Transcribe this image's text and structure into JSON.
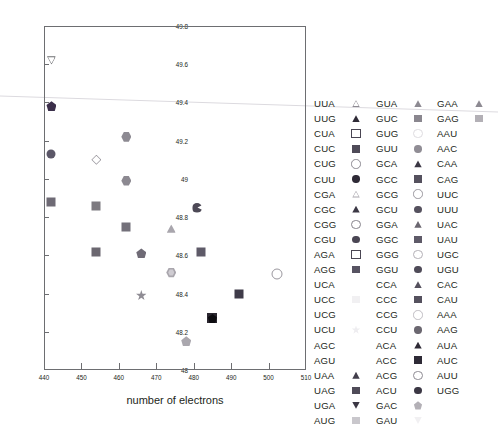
{
  "chart_data": {
    "type": "scatter",
    "title": "",
    "xlabel": "number of electrons",
    "ylabel": "",
    "xlim": [
      440,
      510
    ],
    "ylim": [
      48,
      49.8
    ],
    "xticks": [
      440,
      450,
      460,
      470,
      480,
      490,
      500,
      510
    ],
    "yticks": [
      "48",
      "48.2",
      "48.4",
      "48.6",
      "48.8",
      "49",
      "49.2",
      "49.4",
      "49.6",
      "49.8"
    ],
    "grid": false,
    "legend_position": "right",
    "legend_columns": 3,
    "points": [
      {
        "label": "UUA",
        "x": 442,
        "y": 49.62,
        "marker": "triangle-down-open",
        "color": "#ffffff",
        "edge": "#6d6e71"
      },
      {
        "label": "CUU",
        "x": 442,
        "y": 49.38,
        "marker": "pentagon-filled",
        "color": "#3b2f4a"
      },
      {
        "label": "CGU",
        "x": 442,
        "y": 49.13,
        "marker": "circle-filled",
        "color": "#5b5768"
      },
      {
        "label": "AGG",
        "x": 442,
        "y": 48.88,
        "marker": "square-filled",
        "color": "#6e6a75"
      },
      {
        "label": "GUC",
        "x": 454,
        "y": 48.86,
        "marker": "square-filled",
        "color": "#7d7a80"
      },
      {
        "label": "CGG",
        "x": 454,
        "y": 49.1,
        "marker": "diamond-open",
        "color": "#ffffff",
        "edge": "#9a979e"
      },
      {
        "label": "GCC",
        "x": 454,
        "y": 48.62,
        "marker": "square-filled",
        "color": "#6b6770"
      },
      {
        "label": "GUU",
        "x": 462,
        "y": 49.22,
        "marker": "hexagon-filled",
        "color": "#8d8a92"
      },
      {
        "label": "GGC",
        "x": 462,
        "y": 48.99,
        "marker": "hexagon-filled",
        "color": "#8c8991"
      },
      {
        "label": "CCC",
        "x": 462,
        "y": 48.75,
        "marker": "square-filled",
        "color": "#73707a"
      },
      {
        "label": "GCU",
        "x": 466,
        "y": 48.61,
        "marker": "pentagon-filled",
        "color": "#6f6b76"
      },
      {
        "label": "ACU",
        "x": 466,
        "y": 48.39,
        "marker": "star-filled",
        "color": "#8f8c94"
      },
      {
        "label": "GAC",
        "x": 474,
        "y": 48.74,
        "marker": "triangle-up-filled",
        "color": "#a9a6ad"
      },
      {
        "label": "UCU",
        "x": 474,
        "y": 48.51,
        "marker": "hexagon-open",
        "color": "#cfccd2",
        "edge": "#a9a6ad"
      },
      {
        "label": "AGU",
        "x": 478,
        "y": 48.15,
        "marker": "pentagon-filled",
        "color": "#aaa7ae"
      },
      {
        "label": "UGA",
        "x": 481,
        "y": 48.85,
        "marker": "pacman-filled",
        "color": "#4d4956"
      },
      {
        "label": "UAG",
        "x": 482,
        "y": 48.62,
        "marker": "square-filled",
        "color": "#5e5a68"
      },
      {
        "label": "AUG",
        "x": 485,
        "y": 48.27,
        "marker": "square-pentagon-overlap",
        "color": "#231f20"
      },
      {
        "label": "UCA",
        "x": 492,
        "y": 48.4,
        "marker": "square-filled",
        "color": "#3f3b49"
      },
      {
        "label": "UCC",
        "x": 502,
        "y": 48.51,
        "marker": "circle-open",
        "color": "#ffffff",
        "edge": "#9a979e"
      }
    ]
  },
  "axes": {
    "xlabel": "number of electrons",
    "xticks": [
      "440",
      "450",
      "460",
      "470",
      "480",
      "490",
      "500",
      "510"
    ],
    "yticks": [
      "48",
      "48.2",
      "48.4",
      "48.6",
      "48.8",
      "49",
      "49.2",
      "49.4",
      "49.6",
      "49.8"
    ]
  },
  "legend": {
    "columns": [
      {
        "entries": [
          {
            "label": "UUA",
            "marker": "triangle-up-open",
            "color": "#ffffff",
            "edge": "#8d8a92"
          },
          {
            "label": "UUG",
            "marker": "triangle-up-filled",
            "color": "#2e2a36",
            "edge": "#2e2a36"
          },
          {
            "label": "CUA",
            "marker": "square-open",
            "color": "#ffffff",
            "edge": "#4a4653"
          },
          {
            "label": "CUC",
            "marker": "square-filled",
            "color": "#4f4b58",
            "edge": "#4f4b58"
          },
          {
            "label": "CUG",
            "marker": "circle-open",
            "color": "#ffffff",
            "edge": "#8d8a92"
          },
          {
            "label": "CUU",
            "marker": "circle-filled",
            "color": "#2e2a36",
            "edge": "#2e2a36"
          },
          {
            "label": "CGA",
            "marker": "triangle-up-open",
            "color": "#ffffff",
            "edge": "#a9a6ad"
          },
          {
            "label": "CGC",
            "marker": "triangle-up-filled",
            "color": "#3b3744",
            "edge": "#3b3744"
          },
          {
            "label": "CGG",
            "marker": "circle-open",
            "color": "#ffffff",
            "edge": "#86838b"
          },
          {
            "label": "CGU",
            "marker": "circle-filled",
            "color": "#4a4653",
            "edge": "#4a4653"
          },
          {
            "label": "AGA",
            "marker": "square-open",
            "color": "#ffffff",
            "edge": "#4a4653"
          },
          {
            "label": "AGG",
            "marker": "square-filled",
            "color": "#575362",
            "edge": "#575362"
          },
          {
            "label": "UCA",
            "marker": "none",
            "color": "#ffffff",
            "edge": "#ffffff"
          },
          {
            "label": "UCC",
            "marker": "square-faint",
            "color": "#f1f0f2",
            "edge": "#f1f0f2"
          },
          {
            "label": "UCG",
            "marker": "none",
            "color": "#ffffff",
            "edge": "#ffffff"
          },
          {
            "label": "UCU",
            "marker": "star-faint",
            "color": "#eeedf0",
            "edge": "#eeedf0"
          },
          {
            "label": "AGC",
            "marker": "none",
            "color": "#ffffff",
            "edge": "#ffffff"
          },
          {
            "label": "AGU",
            "marker": "none",
            "color": "#ffffff",
            "edge": "#ffffff"
          },
          {
            "label": "UAA",
            "marker": "triangle-up-filled",
            "color": "#423e4b",
            "edge": "#423e4b"
          },
          {
            "label": "UAG",
            "marker": "square-filled",
            "color": "#4f4b58",
            "edge": "#4f4b58"
          },
          {
            "label": "UGA",
            "marker": "triangle-down-filled",
            "color": "#3b3744",
            "edge": "#3b3744"
          },
          {
            "label": "AUG",
            "marker": "square-filled",
            "color": "#c9c7cc",
            "edge": "#c9c7cc"
          }
        ]
      },
      {
        "entries": [
          {
            "label": "GUA",
            "marker": "triangle-up-filled",
            "color": "#8d8a92",
            "edge": "#8d8a92"
          },
          {
            "label": "GUC",
            "marker": "square-filled",
            "color": "#8a878f",
            "edge": "#8a878f"
          },
          {
            "label": "GUG",
            "marker": "circle-open",
            "color": "#ffffff",
            "edge": "#dedce0"
          },
          {
            "label": "GUU",
            "marker": "circle-filled",
            "color": "#908d95",
            "edge": "#908d95"
          },
          {
            "label": "GCA",
            "marker": "triangle-up-filled",
            "color": "#3b3744",
            "edge": "#3b3744"
          },
          {
            "label": "GCC",
            "marker": "square-filled",
            "color": "#55515e",
            "edge": "#55515e"
          },
          {
            "label": "GCG",
            "marker": "circle-open",
            "color": "#ffffff",
            "edge": "#9a979e"
          },
          {
            "label": "GCU",
            "marker": "circle-filled",
            "color": "#55515e",
            "edge": "#55515e"
          },
          {
            "label": "GGA",
            "marker": "triangle-up-filled",
            "color": "#6b6770",
            "edge": "#6b6770"
          },
          {
            "label": "GGC",
            "marker": "square-filled",
            "color": "#5e5a68",
            "edge": "#5e5a68"
          },
          {
            "label": "GGG",
            "marker": "circle-open",
            "color": "#ffffff",
            "edge": "#b3b0b6"
          },
          {
            "label": "GGU",
            "marker": "circle-filled",
            "color": "#4f4b58",
            "edge": "#4f4b58"
          },
          {
            "label": "CCA",
            "marker": "triangle-up-filled",
            "color": "#55515e",
            "edge": "#55515e"
          },
          {
            "label": "CCC",
            "marker": "square-filled",
            "color": "#55515e",
            "edge": "#55515e"
          },
          {
            "label": "CCG",
            "marker": "circle-open",
            "color": "#ffffff",
            "edge": "#c0bdc3"
          },
          {
            "label": "CCU",
            "marker": "circle-filled",
            "color": "#6b6770",
            "edge": "#6b6770"
          },
          {
            "label": "ACA",
            "marker": "triangle-up-filled",
            "color": "#2e2a36",
            "edge": "#2e2a36"
          },
          {
            "label": "ACC",
            "marker": "square-filled",
            "color": "#2e2a36",
            "edge": "#2e2a36"
          },
          {
            "label": "ACG",
            "marker": "circle-open",
            "color": "#ffffff",
            "edge": "#8d8a92"
          },
          {
            "label": "ACU",
            "marker": "circle-filled",
            "color": "#3b3744",
            "edge": "#3b3744"
          },
          {
            "label": "GAC",
            "marker": "pentagon-filled",
            "color": "#b3b0b6",
            "edge": "#b3b0b6"
          },
          {
            "label": "GAU",
            "marker": "triangle-down-faint",
            "color": "#f1f0f2",
            "edge": "#f1f0f2"
          }
        ]
      },
      {
        "entries": [
          {
            "label": "GAA",
            "marker": "triangle-up-filled",
            "color": "#8d8a92",
            "edge": "#8d8a92"
          },
          {
            "label": "GAG",
            "marker": "square-filled",
            "color": "#b3b0b6",
            "edge": "#b3b0b6"
          },
          {
            "label": "AAU",
            "marker": "none",
            "color": "#ffffff",
            "edge": "#ffffff"
          },
          {
            "label": "AAC",
            "marker": "none",
            "color": "#ffffff",
            "edge": "#ffffff"
          },
          {
            "label": "CAA",
            "marker": "none",
            "color": "#ffffff",
            "edge": "#ffffff"
          },
          {
            "label": "CAG",
            "marker": "none",
            "color": "#ffffff",
            "edge": "#ffffff"
          },
          {
            "label": "UUC",
            "marker": "none",
            "color": "#ffffff",
            "edge": "#ffffff"
          },
          {
            "label": "UUU",
            "marker": "none",
            "color": "#ffffff",
            "edge": "#ffffff"
          },
          {
            "label": "UAC",
            "marker": "none",
            "color": "#ffffff",
            "edge": "#ffffff"
          },
          {
            "label": "UAU",
            "marker": "none",
            "color": "#ffffff",
            "edge": "#ffffff"
          },
          {
            "label": "UGC",
            "marker": "none",
            "color": "#ffffff",
            "edge": "#ffffff"
          },
          {
            "label": "UGU",
            "marker": "none",
            "color": "#ffffff",
            "edge": "#ffffff"
          },
          {
            "label": "CAC",
            "marker": "none",
            "color": "#ffffff",
            "edge": "#ffffff"
          },
          {
            "label": "CAU",
            "marker": "none",
            "color": "#ffffff",
            "edge": "#ffffff"
          },
          {
            "label": "AAA",
            "marker": "none",
            "color": "#ffffff",
            "edge": "#ffffff"
          },
          {
            "label": "AAG",
            "marker": "none",
            "color": "#ffffff",
            "edge": "#ffffff"
          },
          {
            "label": "AUA",
            "marker": "none",
            "color": "#ffffff",
            "edge": "#ffffff"
          },
          {
            "label": "AUC",
            "marker": "none",
            "color": "#ffffff",
            "edge": "#ffffff"
          },
          {
            "label": "AUU",
            "marker": "none",
            "color": "#ffffff",
            "edge": "#ffffff"
          },
          {
            "label": "UGG",
            "marker": "none",
            "color": "#ffffff",
            "edge": "#ffffff"
          }
        ]
      }
    ]
  },
  "colors": {
    "axis": "#6d6e71",
    "text": "#231f20",
    "background": "#ffffff",
    "artifact_line": "#dcdadf"
  }
}
